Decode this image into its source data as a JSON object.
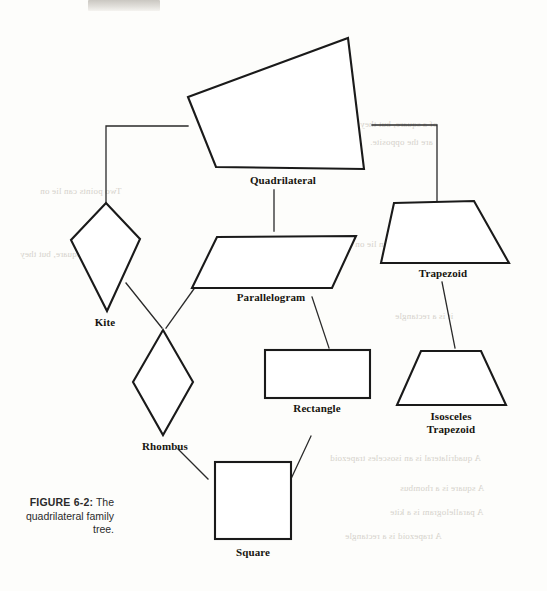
{
  "figure": {
    "caption_number": "FIGURE 6-2:",
    "caption_text": "The quadrilateral family tree.",
    "stroke_color": "#1a1a1a",
    "fill_color": "#ffffff",
    "connector_color": "#2a2a2a"
  },
  "nodes": {
    "quadrilateral": {
      "label": "Quadrilateral"
    },
    "kite": {
      "label": "Kite"
    },
    "parallelogram": {
      "label": "Parallelogram"
    },
    "trapezoid": {
      "label": "Trapezoid"
    },
    "rhombus": {
      "label": "Rhombus"
    },
    "rectangle": {
      "label": "Rectangle"
    },
    "isosceles_trapezoid": {
      "label_line1": "Isosceles",
      "label_line2": "Trapezoid"
    },
    "square": {
      "label": "Square"
    }
  },
  "background_bleed": {
    "line_a": "of a square, but they",
    "line_b": "are the opposite.",
    "line_c": "Two points can lie on",
    "line_d": "it is a rectangle",
    "line_e": "A quadrilateral is an isosceles trapezoid",
    "line_f": "A square is a rhombus",
    "line_g": "A parallelogram is a kite",
    "line_h": "A trapezoid is a rectangle"
  }
}
